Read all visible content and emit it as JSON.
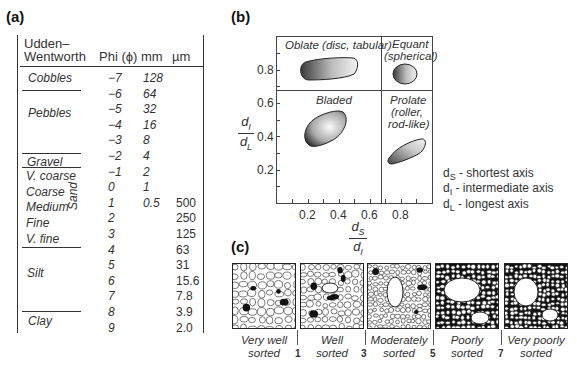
{
  "panel_a": {
    "label": "(a)",
    "headers": {
      "scale_line1": "Udden–",
      "scale_line2": "Wentworth",
      "phi": "Phi (ϕ)",
      "mm": "mm",
      "um": "µm"
    },
    "classes": [
      {
        "name": "Cobbles",
        "y": 60
      },
      {
        "name": "Pebbles",
        "y": 105
      },
      {
        "name": "Gravel",
        "y": 160
      },
      {
        "name": "V. coarse",
        "y": 176
      },
      {
        "name": "Coarse",
        "y": 192
      },
      {
        "name": "Medium",
        "y": 207
      },
      {
        "name": "Fine",
        "y": 222
      },
      {
        "name": "V. fine",
        "y": 237
      },
      {
        "name": "Silt",
        "y": 270
      },
      {
        "name": "Clay",
        "y": 319
      }
    ],
    "sand_label": "Sand",
    "rows": [
      {
        "phi": "−7",
        "mm": "128",
        "um": ""
      },
      {
        "phi": "−6",
        "mm": "64",
        "um": ""
      },
      {
        "phi": "−5",
        "mm": "32",
        "um": ""
      },
      {
        "phi": "−4",
        "mm": "16",
        "um": ""
      },
      {
        "phi": "−3",
        "mm": "8",
        "um": ""
      },
      {
        "phi": "−2",
        "mm": "4",
        "um": ""
      },
      {
        "phi": "−1",
        "mm": "2",
        "um": ""
      },
      {
        "phi": "0",
        "mm": "1",
        "um": ""
      },
      {
        "phi": "1",
        "mm": "0.5",
        "um": "500"
      },
      {
        "phi": "2",
        "mm": "",
        "um": "250"
      },
      {
        "phi": "3",
        "mm": "",
        "um": "125"
      },
      {
        "phi": "4",
        "mm": "",
        "um": "63"
      },
      {
        "phi": "5",
        "mm": "",
        "um": "31"
      },
      {
        "phi": "6",
        "mm": "",
        "um": "15.6"
      },
      {
        "phi": "7",
        "mm": "",
        "um": "7.8"
      },
      {
        "phi": "8",
        "mm": "",
        "um": "3.9"
      },
      {
        "phi": "9",
        "mm": "",
        "um": "2.0"
      }
    ]
  },
  "panel_b": {
    "label": "(b)",
    "quadrants": {
      "oblate": "Oblate (disc, tabular)",
      "equant_1": "Equant",
      "equant_2": "(spherical)",
      "bladed": "Bladed",
      "prolate_1": "Prolate",
      "prolate_2": "(roller,",
      "prolate_3": "rod-like)"
    },
    "y_axis": {
      "num": "d",
      "num_sub": "I",
      "den": "d",
      "den_sub": "L",
      "ticks": [
        "0.2",
        "0.4",
        "0.6",
        "0.8"
      ]
    },
    "x_axis": {
      "num": "d",
      "num_sub": "S",
      "den": "d",
      "den_sub": "I",
      "ticks": [
        "0.2",
        "0.4",
        "0.6",
        "0.8"
      ]
    },
    "legend": [
      {
        "sym": "d",
        "sub": "S",
        "text": " - shortest axis"
      },
      {
        "sym": "d",
        "sub": "I",
        "text": " - intermediate axis"
      },
      {
        "sym": "d",
        "sub": "L",
        "text": " - longest axis"
      }
    ]
  },
  "panel_c": {
    "label": "(c)",
    "boxes": [
      {
        "line1": "Very well",
        "line2": "sorted"
      },
      {
        "line1": "Well",
        "line2": "sorted"
      },
      {
        "line1": "Moderately",
        "line2": "sorted"
      },
      {
        "line1": "Poorly",
        "line2": "sorted"
      },
      {
        "line1": "Very poorly",
        "line2": "sorted"
      }
    ],
    "dividers": [
      "1",
      "3",
      "5",
      "7"
    ]
  }
}
